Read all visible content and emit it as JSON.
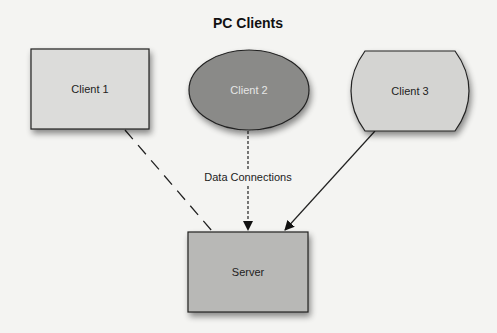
{
  "title": "PC Clients",
  "nodes": {
    "client1": {
      "label": "Client 1",
      "shape": "rectangle",
      "fill": "#dcdcda"
    },
    "client2": {
      "label": "Client 2",
      "shape": "ellipse",
      "fill": "#8a8a88",
      "text_color": "#e6e6e6"
    },
    "client3": {
      "label": "Client 3",
      "shape": "rounded-side-rectangle",
      "fill": "#d4d4d2"
    },
    "server": {
      "label": "Server",
      "shape": "rectangle",
      "fill": "#b8b8b6"
    }
  },
  "edges": [
    {
      "from": "Client 1",
      "to": "Server",
      "style": "long-dash"
    },
    {
      "from": "Client 2",
      "to": "Server",
      "style": "short-dash",
      "label": "Data Connections"
    },
    {
      "from": "Client 3",
      "to": "Server",
      "style": "solid"
    }
  ]
}
